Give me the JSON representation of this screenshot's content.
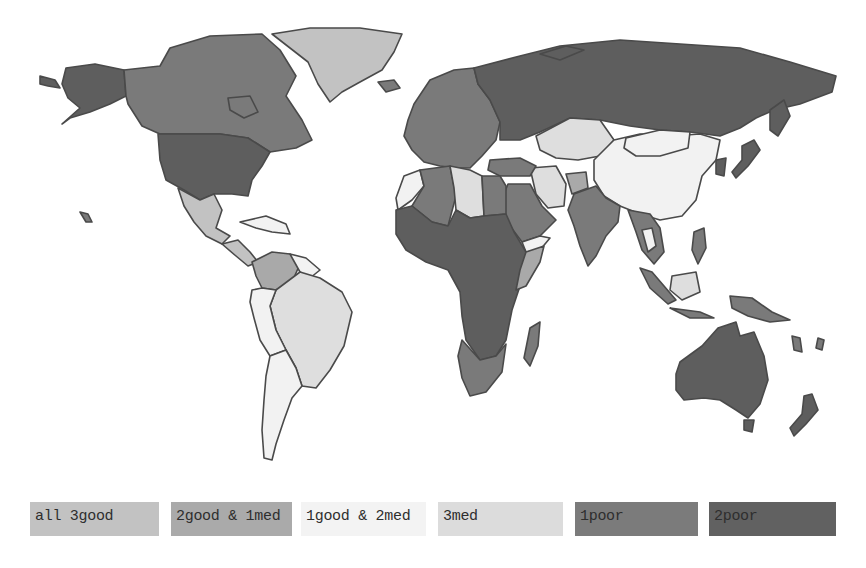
{
  "colors": {
    "all_3_good": "#c2c2c2",
    "2good_1med": "#a9a9a9",
    "1good_2med": "#f2f2f2",
    "3med": "#dedede",
    "1poor": "#7a7a7a",
    "2poor": "#5e5e5e",
    "ocean": "#ffffff",
    "border": "#4a4a4a"
  },
  "legend": {
    "items": [
      {
        "key": "all_3_good",
        "label": "all 3good",
        "color": "#c2c2c2"
      },
      {
        "key": "2good_1med",
        "label": "2good & 1med",
        "color": "#aaaaaa"
      },
      {
        "key": "1good_2med",
        "label": "1good & 2med",
        "color": "#f3f3f3"
      },
      {
        "key": "3med",
        "label": "3med",
        "color": "#dcdcdc"
      },
      {
        "key": "1poor",
        "label": "1poor",
        "color": "#7b7b7b"
      },
      {
        "key": "2poor",
        "label": "2poor",
        "color": "#616161"
      }
    ]
  },
  "regions": [
    {
      "name": "Greenland",
      "category": "all_3_good"
    },
    {
      "name": "Canada",
      "category": "1poor"
    },
    {
      "name": "Alaska",
      "category": "2poor"
    },
    {
      "name": "United States",
      "category": "2poor"
    },
    {
      "name": "Mexico",
      "category": "all_3_good"
    },
    {
      "name": "Colombia",
      "category": "2good_1med"
    },
    {
      "name": "Brazil",
      "category": "3med"
    },
    {
      "name": "Argentina",
      "category": "1good_2med"
    },
    {
      "name": "Peru/Bolivia",
      "category": "1good_2med"
    },
    {
      "name": "Russia",
      "category": "2poor"
    },
    {
      "name": "Kazakhstan",
      "category": "3med"
    },
    {
      "name": "China",
      "category": "1good_2med"
    },
    {
      "name": "Mongolia",
      "category": "1good_2med"
    },
    {
      "name": "Iran",
      "category": "3med"
    },
    {
      "name": "India",
      "category": "1poor"
    },
    {
      "name": "Libya",
      "category": "3med"
    },
    {
      "name": "Algeria",
      "category": "1poor"
    },
    {
      "name": "Egypt",
      "category": "1poor"
    },
    {
      "name": "Saudi Arabia",
      "category": "1poor"
    },
    {
      "name": "Sub-Saharan Africa",
      "category": "2poor"
    },
    {
      "name": "Southern Africa",
      "category": "1poor"
    },
    {
      "name": "Madagascar",
      "category": "1poor"
    },
    {
      "name": "Australia",
      "category": "2poor"
    },
    {
      "name": "New Zealand",
      "category": "2poor"
    },
    {
      "name": "Europe",
      "category": "1poor"
    },
    {
      "name": "Southeast Asia",
      "category": "1poor"
    },
    {
      "name": "Japan",
      "category": "2poor"
    }
  ]
}
